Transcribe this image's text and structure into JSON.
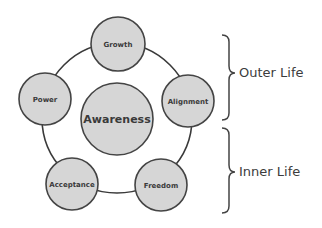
{
  "colors": {
    "circle_fill": "#d6d6d6",
    "circle_stroke": "#444444",
    "ring_stroke": "#3a3a3a",
    "text": "#3a3a3a"
  },
  "center_node": {
    "label": "Awareness"
  },
  "nodes": [
    {
      "label": "Growth"
    },
    {
      "label": "Power"
    },
    {
      "label": "Alignment"
    },
    {
      "label": "Acceptance"
    },
    {
      "label": "Freedom"
    }
  ],
  "groups": [
    {
      "label": "Outer Life"
    },
    {
      "label": "Inner Life"
    }
  ]
}
